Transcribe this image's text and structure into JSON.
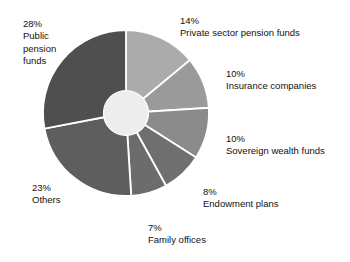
{
  "chart_data": {
    "type": "pie",
    "title": "",
    "subtitle": "",
    "xlabel": "",
    "ylabel": "",
    "legend_position": "callout-labels",
    "grid": false,
    "donut": true,
    "start_angle_deg": 0,
    "direction": "clockwise",
    "units": "percent",
    "categories": [
      "Private sector pension funds",
      "Insurance companies",
      "Sovereign wealth funds",
      "Endowment plans",
      "Family offices",
      "Others",
      "Public pension funds"
    ],
    "values": [
      14,
      10,
      10,
      8,
      7,
      23,
      28
    ],
    "colors": [
      "#ababab",
      "#9a9a9a",
      "#8b8b8b",
      "#6f6f6f",
      "#6c6c6c",
      "#5e5e5e",
      "#4f4f4f"
    ],
    "center_color": "#ededed",
    "divider_color": "#ffffff"
  },
  "slices": [
    {
      "pct": "14%",
      "name": "Private sector pension funds",
      "value": 14,
      "color": "#ababab"
    },
    {
      "pct": "10%",
      "name": "Insurance companies",
      "value": 10,
      "color": "#9a9a9a"
    },
    {
      "pct": "10%",
      "name": "Sovereign wealth funds",
      "value": 10,
      "color": "#8b8b8b"
    },
    {
      "pct": "8%",
      "name": "Endowment plans",
      "value": 8,
      "color": "#6f6f6f"
    },
    {
      "pct": "7%",
      "name": "Family offices",
      "value": 7,
      "color": "#6c6c6c"
    },
    {
      "pct": "23%",
      "name": "Others",
      "value": 23,
      "color": "#5e5e5e"
    },
    {
      "pct": "28%",
      "name": "Public\npension\nfunds",
      "value": 28,
      "color": "#4f4f4f"
    }
  ]
}
